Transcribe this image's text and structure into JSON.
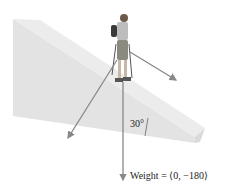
{
  "diagram": {
    "angle_label": "30°",
    "weight_label": "Weight = ⟨0, −180⟩",
    "colors": {
      "slope_face": "#e2e2e2",
      "slope_top": "#ececec",
      "slope_side": "#d6d6d6",
      "arrow": "#888888",
      "text": "#222222"
    },
    "vectors": [
      {
        "name": "weight",
        "direction": "straight down"
      },
      {
        "name": "normal-component",
        "direction": "down-left, perpendicular to slope"
      },
      {
        "name": "parallel-component",
        "direction": "down the slope"
      }
    ]
  }
}
